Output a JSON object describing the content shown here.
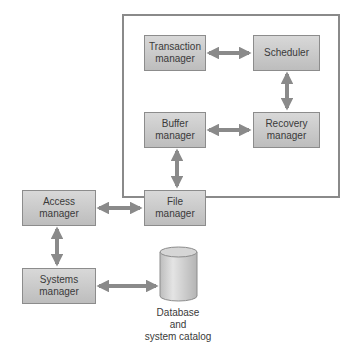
{
  "diagram": {
    "title": "",
    "colors": {
      "box_fill_top": "#d8d8d8",
      "box_fill_bottom": "#bdbdbd",
      "box_border": "#8c8c8c",
      "arrow": "#8a8a8a",
      "container_border": "#8a8a8a",
      "text": "#3a3a3a"
    },
    "container": {
      "label": ""
    },
    "nodes": {
      "transaction_manager": {
        "line1": "Transaction",
        "line2": "manager"
      },
      "scheduler": {
        "line1": "Scheduler"
      },
      "buffer_manager": {
        "line1": "Buffer",
        "line2": "manager"
      },
      "recovery_manager": {
        "line1": "Recovery",
        "line2": "manager"
      },
      "file_manager": {
        "line1": "File",
        "line2": "manager"
      },
      "access_manager": {
        "line1": "Access",
        "line2": "manager"
      },
      "systems_manager": {
        "line1": "Systems",
        "line2": "manager"
      },
      "database": {
        "line1": "Database",
        "line2": "and",
        "line3": "system catalog"
      }
    },
    "edges": [
      {
        "from": "Transaction manager",
        "to": "Scheduler",
        "type": "bidirectional"
      },
      {
        "from": "Scheduler",
        "to": "Recovery manager",
        "type": "bidirectional"
      },
      {
        "from": "Buffer manager",
        "to": "Recovery manager",
        "type": "bidirectional"
      },
      {
        "from": "Buffer manager",
        "to": "File manager",
        "type": "bidirectional"
      },
      {
        "from": "Access manager",
        "to": "File manager",
        "type": "bidirectional"
      },
      {
        "from": "Access manager",
        "to": "Systems manager",
        "type": "bidirectional"
      },
      {
        "from": "Systems manager",
        "to": "Database and system catalog",
        "type": "bidirectional"
      }
    ]
  }
}
